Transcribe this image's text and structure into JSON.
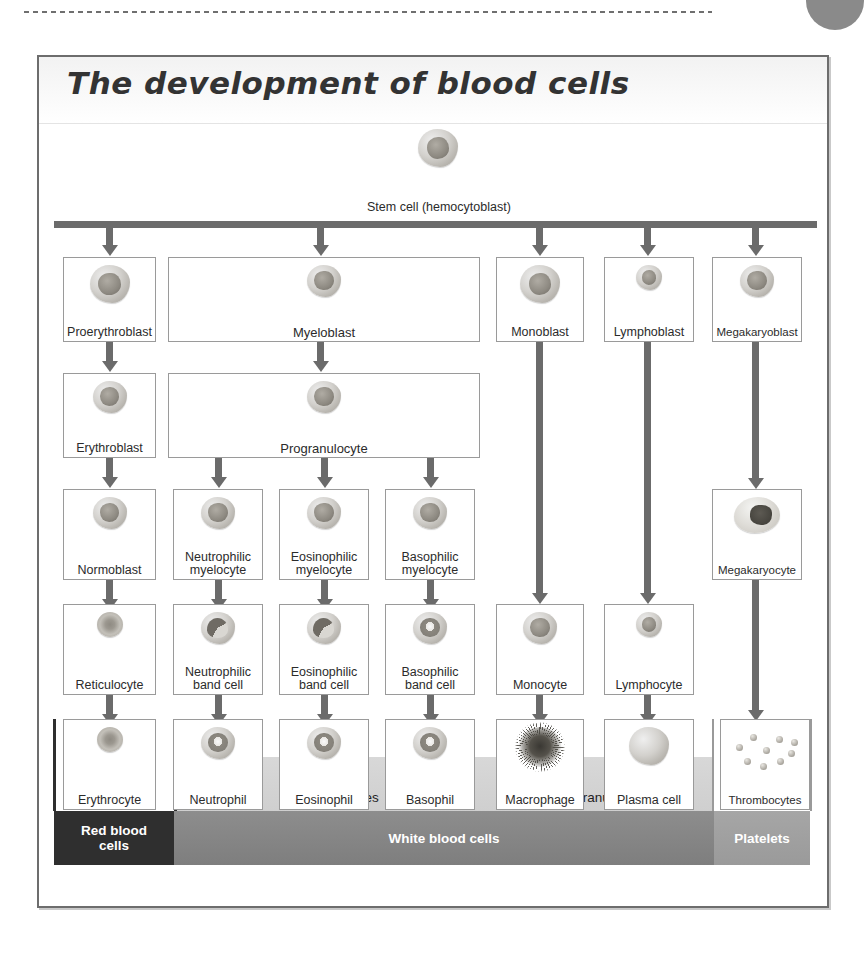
{
  "page": {
    "bullet_icon": "page-number-circle",
    "dots_icon": "dotted-rule"
  },
  "figure": {
    "title": "The development of blood cells",
    "stem_cell": {
      "label": "Stem cell (hemocytoblast)",
      "icon": "stem-cell-image"
    },
    "rows": {
      "row1": [
        {
          "key": "proerythroblast",
          "label": "Proerythroblast",
          "icon": "proerythroblast-cell-image"
        },
        {
          "key": "myeloblast",
          "label": "Myeloblast",
          "icon": "myeloblast-cell-image"
        },
        {
          "key": "monoblast",
          "label": "Monoblast",
          "icon": "monoblast-cell-image"
        },
        {
          "key": "lymphoblast",
          "label": "Lymphoblast",
          "icon": "lymphoblast-cell-image"
        },
        {
          "key": "megakaryoblast",
          "label": "Megakaryoblast",
          "icon": "megakaryoblast-cell-image"
        }
      ],
      "row2": [
        {
          "key": "erythroblast",
          "label": "Erythroblast",
          "icon": "erythroblast-cell-image"
        },
        {
          "key": "progranulocyte",
          "label": "Progranulocyte",
          "icon": "progranulocyte-cell-image"
        }
      ],
      "row3": [
        {
          "key": "normoblast",
          "label": "Normoblast",
          "icon": "normoblast-cell-image"
        },
        {
          "key": "neutrophilic-myelocyte",
          "label": "Neutrophilic\nmyelocyte",
          "line1": "Neutrophilic",
          "line2": "myelocyte",
          "icon": "neutrophilic-myelocyte-cell-image"
        },
        {
          "key": "eosinophilic-myelocyte",
          "label": "Eosinophilic\nmyelocyte",
          "line1": "Eosinophilic",
          "line2": "myelocyte",
          "icon": "eosinophilic-myelocyte-cell-image"
        },
        {
          "key": "basophilic-myelocyte",
          "label": "Basophilic\nmyelocyte",
          "line1": "Basophilic",
          "line2": "myelocyte",
          "icon": "basophilic-myelocyte-cell-image"
        },
        {
          "key": "megakaryocyte",
          "label": "Megakaryocyte",
          "icon": "megakaryocyte-cell-image"
        }
      ],
      "row4": [
        {
          "key": "reticulocyte",
          "label": "Reticulocyte",
          "icon": "reticulocyte-cell-image"
        },
        {
          "key": "neutrophilic-band-cell",
          "line1": "Neutrophilic",
          "line2": "band cell",
          "icon": "neutrophilic-band-cell-image"
        },
        {
          "key": "eosinophilic-band-cell",
          "line1": "Eosinophilic",
          "line2": "band cell",
          "icon": "eosinophilic-band-cell-image"
        },
        {
          "key": "basophilic-band-cell",
          "line1": "Basophilic",
          "line2": "band cell",
          "icon": "basophilic-band-cell-image"
        },
        {
          "key": "monocyte",
          "label": "Monocyte",
          "icon": "monocyte-cell-image"
        },
        {
          "key": "lymphocyte",
          "label": "Lymphocyte",
          "icon": "lymphocyte-cell-image"
        }
      ],
      "row5": [
        {
          "key": "erythrocyte",
          "label": "Erythrocyte",
          "icon": "erythrocyte-cell-image"
        },
        {
          "key": "neutrophil",
          "label": "Neutrophil",
          "icon": "neutrophil-cell-image"
        },
        {
          "key": "eosinophil",
          "label": "Eosinophil",
          "icon": "eosinophil-cell-image"
        },
        {
          "key": "basophil",
          "label": "Basophil",
          "icon": "basophil-cell-image"
        },
        {
          "key": "macrophage",
          "label": "Macrophage",
          "icon": "macrophage-cell-image"
        },
        {
          "key": "plasma-cell",
          "label": "Plasma cell",
          "icon": "plasma-cell-image"
        },
        {
          "key": "thrombocytes",
          "label": "Thrombocytes",
          "icon": "thrombocytes-image"
        }
      ]
    },
    "subgroups": {
      "granulocytes": "Granulocytes",
      "agranulocytes": "Agranulocytes"
    },
    "categories": {
      "red_blood_cells_line1": "Red blood",
      "red_blood_cells_line2": "cells",
      "white_blood_cells": "White blood cells",
      "platelets": "Platelets"
    },
    "colors": {
      "frame_border": "#6d6d6d",
      "box_border": "#9a9a9a",
      "arrow": "#6b6b6b",
      "red_blood_band": "#2f2f2f",
      "white_blood_band": "#7e7e7e",
      "platelet_band": "#9a9a9a",
      "subgroup_band": "#d4d4d4",
      "page_bullet": "#8a8a8a"
    }
  }
}
